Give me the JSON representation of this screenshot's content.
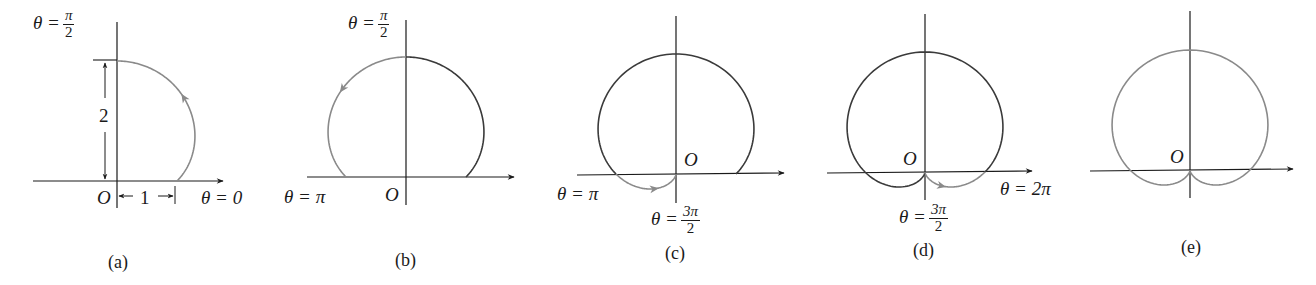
{
  "figure": {
    "curve_equation": "r = 1 + sin θ",
    "stroke_colors": {
      "dark": "#3a3a3a",
      "traced": "#8a8a8a",
      "axis": "#1a1a1a"
    },
    "panels": [
      {
        "id": "a",
        "caption": "(a)",
        "labels": {
          "theta_top": "θ =",
          "theta_top_num": "π",
          "theta_top_den": "2",
          "origin": "O",
          "theta_right": "θ = 0",
          "radius_label": "2",
          "unit_label": "1"
        }
      },
      {
        "id": "b",
        "caption": "(b)",
        "labels": {
          "theta_top": "θ =",
          "theta_top_num": "π",
          "theta_top_den": "2",
          "theta_left": "θ = π",
          "origin": "O"
        }
      },
      {
        "id": "c",
        "caption": "(c)",
        "labels": {
          "origin": "O",
          "theta_left": "θ = π",
          "theta_bottom": "θ =",
          "theta_bottom_num": "3π",
          "theta_bottom_den": "2"
        }
      },
      {
        "id": "d",
        "caption": "(d)",
        "labels": {
          "origin": "O",
          "theta_right": "θ = 2π",
          "theta_bottom": "θ =",
          "theta_bottom_num": "3π",
          "theta_bottom_den": "2"
        }
      },
      {
        "id": "e",
        "caption": "(e)",
        "labels": {
          "origin": "O"
        }
      }
    ]
  },
  "chart_data": {
    "type": "polar-curve",
    "function": "r = 1 + sin(theta)",
    "scale_px_per_unit": 60,
    "panels": [
      {
        "id": "a",
        "origin": [
          117,
          181
        ],
        "segments": [
          {
            "from": 0,
            "to": 1.5708,
            "style": "traced",
            "arrow_at": 0.9
          }
        ]
      },
      {
        "id": "b",
        "origin": [
          406,
          177
        ],
        "segments": [
          {
            "from": 0,
            "to": 1.5708,
            "style": "dark"
          },
          {
            "from": 1.5708,
            "to": 3.1416,
            "style": "traced",
            "arrow_at": 2.2
          }
        ]
      },
      {
        "id": "c",
        "origin": [
          676,
          174
        ],
        "segments": [
          {
            "from": 0,
            "to": 3.1416,
            "style": "dark"
          },
          {
            "from": 3.1416,
            "to": 4.7124,
            "style": "traced",
            "arrow_at": 3.75
          }
        ]
      },
      {
        "id": "d",
        "origin": [
          925,
          172
        ],
        "segments": [
          {
            "from": 0,
            "to": 4.7124,
            "style": "dark"
          },
          {
            "from": 4.7124,
            "to": 6.2832,
            "style": "traced",
            "arrow_at": 5.6
          }
        ]
      },
      {
        "id": "e",
        "origin": [
          1190,
          170
        ],
        "segments": [
          {
            "from": 0,
            "to": 6.2832,
            "style": "traced"
          }
        ]
      }
    ],
    "annotations": [
      "θ = π/2",
      "θ = 0",
      "θ = π",
      "θ = 3π/2",
      "θ = 2π",
      "O",
      "2",
      "1"
    ],
    "grid": false,
    "legend": null
  }
}
